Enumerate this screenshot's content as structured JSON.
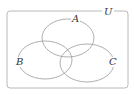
{
  "diagram": {
    "type": "venn",
    "universe": {
      "label": "U",
      "x": 7,
      "y": 11,
      "width": 121,
      "height": 77,
      "corner_radius": 3
    },
    "sets": [
      {
        "label": "A",
        "cx": 68,
        "cy": 38,
        "rx": 26,
        "ry": 19,
        "label_x": 75,
        "label_y": 22
      },
      {
        "label": "B",
        "cx": 45,
        "cy": 60,
        "rx": 27,
        "ry": 19,
        "label_x": 19,
        "label_y": 65
      },
      {
        "label": "C",
        "cx": 87,
        "cy": 63,
        "rx": 27,
        "ry": 19,
        "label_x": 112,
        "label_y": 65
      }
    ],
    "colors": {
      "stroke": "#9a9a9a",
      "frame": "#a8a8a8",
      "label": "#333333",
      "background": "#ffffff"
    }
  }
}
